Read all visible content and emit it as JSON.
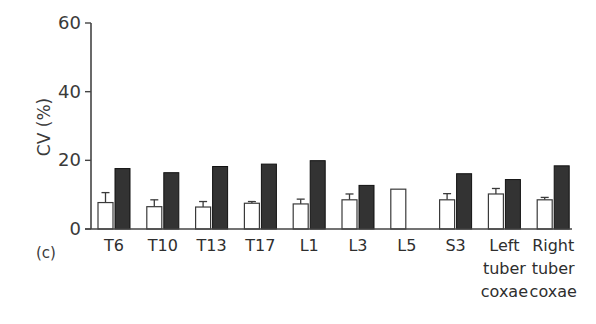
{
  "chart_data": {
    "type": "bar",
    "title": "",
    "panel_label": "(c)",
    "xlabel": "",
    "ylabel": "CV (%)",
    "ylim": [
      0,
      60
    ],
    "yticks": [
      0,
      20,
      40,
      60
    ],
    "grid": false,
    "legend": null,
    "categories": [
      "T6",
      "T10",
      "T13",
      "T17",
      "L1",
      "L3",
      "L5",
      "S3",
      "Left tuber coxae",
      "Right tuber coxae"
    ],
    "category_label_lines": [
      [
        "T6"
      ],
      [
        "T10"
      ],
      [
        "T13"
      ],
      [
        "T17"
      ],
      [
        "L1"
      ],
      [
        "L3"
      ],
      [
        "L5"
      ],
      [
        "S3"
      ],
      [
        "Left",
        "tuber",
        "coxae"
      ],
      [
        "Right",
        "tuber",
        "coxae"
      ]
    ],
    "series": [
      {
        "name": "open bars",
        "fill": "#ffffff",
        "values": [
          7.7,
          6.5,
          6.4,
          7.5,
          7.3,
          8.5,
          11.6,
          8.5,
          10.2,
          8.5
        ],
        "error_upper": [
          10.6,
          8.5,
          8.0,
          8.0,
          8.7,
          10.2,
          null,
          10.3,
          11.8,
          9.2
        ]
      },
      {
        "name": "filled bars",
        "fill": "#333333",
        "values": [
          17.6,
          16.4,
          18.2,
          18.9,
          19.9,
          12.7,
          null,
          16.1,
          14.4,
          18.4
        ]
      }
    ]
  },
  "colors": {
    "axis": "#444444",
    "open_bar_fill": "#ffffff",
    "open_bar_stroke": "#3a3a3a",
    "filled_bar_fill": "#333333",
    "filled_bar_stroke": "#111111"
  }
}
